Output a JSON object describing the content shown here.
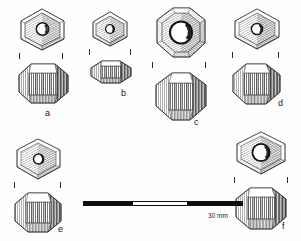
{
  "plate": {
    "type": "archaeological-illustration",
    "subject": "faceted beads",
    "background_color": "#fefefe",
    "ink_color": "#2b2b2b",
    "views_per_specimen": [
      "top view with central perforation",
      "profile view"
    ]
  },
  "specimens": [
    {
      "id": "a",
      "label": "a",
      "outline": "hexagonal",
      "top_view": {
        "facets": 6,
        "perforation": "small central circular"
      },
      "profile_view": {
        "outline": "octagonal barrel",
        "facets": 8
      },
      "tick_marks": 2
    },
    {
      "id": "b",
      "label": "b",
      "outline": "hexagonal",
      "top_view": {
        "facets": 6,
        "perforation": "small central circular"
      },
      "profile_view": {
        "outline": "flattened lenticular",
        "facets": 8
      },
      "tick_marks": 2
    },
    {
      "id": "c",
      "label": "c",
      "outline": "octagonal",
      "top_view": {
        "facets": 8,
        "perforation": "large central circular"
      },
      "profile_view": {
        "outline": "octagonal barrel",
        "facets": 8
      },
      "tick_marks": 2
    },
    {
      "id": "d",
      "label": "d",
      "outline": "hexagonal",
      "top_view": {
        "facets": 6,
        "perforation": "small central circular"
      },
      "profile_view": {
        "outline": "octagonal barrel",
        "facets": 8
      },
      "tick_marks": 2
    },
    {
      "id": "e",
      "label": "e",
      "outline": "hexagonal",
      "top_view": {
        "facets": 6,
        "perforation": "small central circular"
      },
      "profile_view": {
        "outline": "octagonal barrel",
        "facets": 8
      },
      "tick_marks": 2
    },
    {
      "id": "f",
      "label": "f",
      "outline": "hexagonal",
      "top_view": {
        "facets": 6,
        "perforation": "large central circular"
      },
      "profile_view": {
        "outline": "octagonal barrel",
        "facets": 8
      },
      "tick_marks": 2
    }
  ],
  "scale": {
    "label": "30 mm",
    "segments": [
      "black",
      "white",
      "black"
    ],
    "segment_colors": {
      "black": "#0d0d0d",
      "white": "#ffffff"
    }
  }
}
